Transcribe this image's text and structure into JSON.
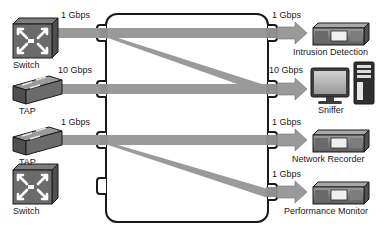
{
  "diagram": {
    "type": "network-topology",
    "title": "",
    "colors": {
      "link_gray": "#9a9a9a",
      "device_dark": "#4a4a4a",
      "device_mid": "#6e6e6e",
      "device_light": "#b4b4b4",
      "outline": "#1a1a1a",
      "background": "#ffffff"
    },
    "central_device": {
      "name": "packet-broker",
      "label": "",
      "left_ports": 4,
      "right_ports": 4
    },
    "sources": [
      {
        "id": "src1",
        "label": "Switch",
        "icon": "switch-icon",
        "rate": "1 Gbps",
        "connected": true,
        "port": 1
      },
      {
        "id": "src2",
        "label": "TAP",
        "icon": "tap-icon",
        "rate": "10 Gbps",
        "connected": true,
        "port": 2
      },
      {
        "id": "src3",
        "label": "TAP",
        "icon": "tap-icon",
        "rate": "1 Gbps",
        "connected": true,
        "port": 3
      },
      {
        "id": "src4",
        "label": "Switch",
        "icon": "switch-icon",
        "rate": "",
        "connected": false,
        "port": 4
      }
    ],
    "destinations": [
      {
        "id": "dst1",
        "label": "Intrusion Detection",
        "icon": "appliance-icon",
        "rate": "1 Gbps",
        "port": 1
      },
      {
        "id": "dst2",
        "label": "Sniffer",
        "icon": "workstation-icon",
        "rate": "10 Gbps",
        "port": 2
      },
      {
        "id": "dst3",
        "label": "Network Recorder",
        "icon": "appliance-icon",
        "rate": "1 Gbps",
        "port": 3
      },
      {
        "id": "dst4",
        "label": "Performance Monitor",
        "icon": "appliance-icon",
        "rate": "1 Gbps",
        "port": 4
      }
    ],
    "internal_paths": [
      {
        "from_port": 1,
        "to_port": 1,
        "shape": "straight"
      },
      {
        "from_port": 1,
        "to_port": 2,
        "shape": "diagonal"
      },
      {
        "from_port": 2,
        "to_port": 2,
        "shape": "straight"
      },
      {
        "from_port": 3,
        "to_port": 3,
        "shape": "straight"
      },
      {
        "from_port": 3,
        "to_port": 4,
        "shape": "diagonal"
      }
    ]
  }
}
